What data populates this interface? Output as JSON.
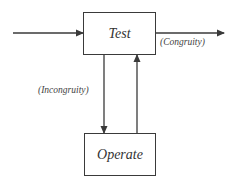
{
  "diagram": {
    "type": "TOTE feedback loop",
    "nodes": [
      {
        "id": "test",
        "label": "Test"
      },
      {
        "id": "operate",
        "label": "Operate"
      }
    ],
    "edges": [
      {
        "from": "input",
        "to": "test",
        "label": ""
      },
      {
        "from": "test",
        "to": "output",
        "label": "(Congruity)"
      },
      {
        "from": "test",
        "to": "operate",
        "label": "(Incongruity)"
      },
      {
        "from": "operate",
        "to": "test",
        "label": ""
      }
    ]
  },
  "colors": {
    "line": "#3a3a3a",
    "text": "#333333",
    "background": "#ffffff"
  }
}
